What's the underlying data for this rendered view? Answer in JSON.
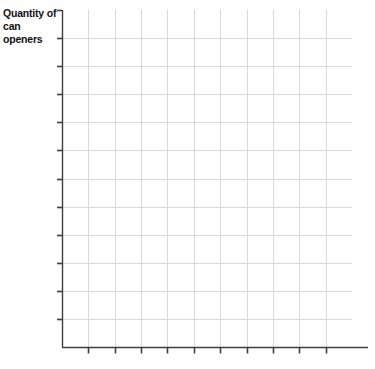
{
  "chart_data": {
    "type": "grid",
    "title": "",
    "subtitle": "",
    "ylabel": "Quantity of\ncan openers",
    "xlabel": "",
    "series": [],
    "categories": [],
    "values": [],
    "x_tick_labels": [],
    "y_tick_labels": [],
    "x_tick_count": 11,
    "y_tick_count": 12,
    "grid": true,
    "grid_columns": 11,
    "grid_rows": 12,
    "legend": false,
    "legend_position": "none",
    "annotations": [],
    "note": "Blank coordinate grid with no plotted data"
  },
  "axes": {
    "y_title_line1": "Quantity of",
    "y_title_line2": "can openers",
    "y_title": "Quantity of\ncan openers"
  },
  "colors": {
    "background": "#ffffff",
    "grid_line": "#d9d9d9",
    "axis_line": "#3f3f3f",
    "tick_mark": "#3f3f3f",
    "label_text": "#121212"
  }
}
